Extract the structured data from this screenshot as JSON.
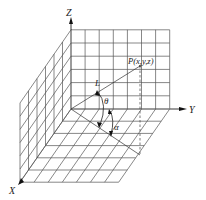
{
  "diagram": {
    "title": "",
    "axes": {
      "z_label": "Z",
      "y_label": "Y",
      "x_label": "X"
    },
    "point_label": "P(x,y,z)",
    "vector_label": "L",
    "angles": {
      "theta": "θ",
      "alpha": "α"
    },
    "grid": {
      "back_wall": {
        "cols": 7,
        "rows": 6
      },
      "left_wall": {
        "cols": 6,
        "rows": 6
      },
      "floor": {
        "cols": 7,
        "rows": 6
      }
    },
    "colors": {
      "line": "#555555",
      "text": "#222222",
      "background": "#ffffff"
    }
  }
}
